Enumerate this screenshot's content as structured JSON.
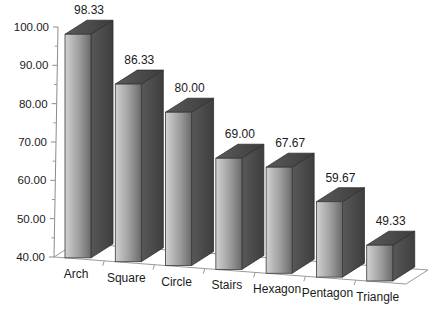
{
  "chart_data": {
    "type": "bar",
    "title": "",
    "subtitle": "",
    "xlabel": "",
    "ylabel": "",
    "categories": [
      "Arch",
      "Square",
      "Circle",
      "Stairs",
      "Hexagon",
      "Pentagon",
      "Triangle"
    ],
    "values": [
      98.33,
      86.33,
      80.0,
      69.0,
      67.67,
      59.67,
      49.33
    ],
    "value_labels": [
      "98.33",
      "86.33",
      "80.00",
      "69.00",
      "67.67",
      "59.67",
      "49.33"
    ],
    "ylim": [
      40.0,
      100.0
    ],
    "ytick_values": [
      40.0,
      50.0,
      60.0,
      70.0,
      80.0,
      90.0,
      100.0
    ],
    "ytick_labels": [
      "40.00",
      "50.00",
      "60.00",
      "70.00",
      "80.00",
      "90.00",
      "100.00"
    ],
    "minor_tick_step": 5,
    "grid": false,
    "legend": false,
    "legend_position": "none",
    "three_d": true,
    "series": [
      {
        "name": "",
        "values": [
          98.33,
          86.33,
          80.0,
          69.0,
          67.67,
          59.67,
          49.33
        ]
      }
    ]
  },
  "style": {
    "background": "#ffffff",
    "bar_face_light": "#c6c6c6",
    "bar_face_dark": "#6e6e6e",
    "bar_side": "#4e4e4e",
    "bar_top": "#4a4a4a",
    "axis_color": "#8c8c8c",
    "text_color": "#1a1a1a"
  }
}
